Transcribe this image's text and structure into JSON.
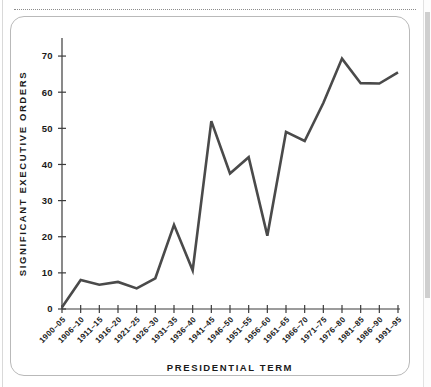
{
  "figure": {
    "background_color": "#ffffff",
    "border_color": "#b9b9b9",
    "line_color": "#4a4a4a",
    "axis_color": "#3b3b3b",
    "dotted_rule_color": "#8c8c8c"
  },
  "chart_data": {
    "type": "line",
    "title": "",
    "xlabel": "PRESIDENTIAL TERM",
    "ylabel": "SIGNIFICANT EXECUTIVE ORDERS",
    "grid": false,
    "legend": "none",
    "ylim": [
      0,
      75
    ],
    "yticks": [
      0,
      10,
      20,
      30,
      40,
      50,
      60,
      70
    ],
    "categories": [
      "1900–05",
      "1906–10",
      "1911–15",
      "1916–20",
      "1921–25",
      "1926–30",
      "1931–35",
      "1936–40",
      "1941–45",
      "1946–50",
      "1951–55",
      "1956–60",
      "1961–65",
      "1966–70",
      "1971–75",
      "1976–80",
      "1981–85",
      "1986–90",
      "1991–95"
    ],
    "values": [
      0.5,
      8,
      6.7,
      7.5,
      5.7,
      8.5,
      23.3,
      10.7,
      52,
      37.5,
      42,
      20.3,
      49,
      46.5,
      57,
      69.3,
      62.5,
      62.4,
      65.5
    ]
  }
}
